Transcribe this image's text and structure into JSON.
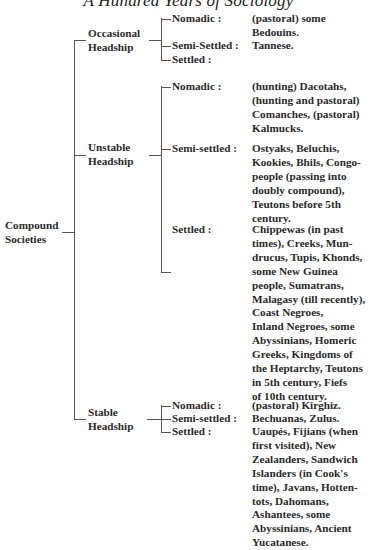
{
  "page": {
    "running_header": "A Hundred Years of Sociology"
  },
  "root": {
    "label_lines": [
      "Compound",
      "Societies"
    ]
  },
  "groups": [
    {
      "label_lines": [
        "Occasional",
        "Headship"
      ],
      "rows": [
        {
          "label": "Nomadic :",
          "value_lines": [
            "(pastoral) some",
            "Bedouins."
          ]
        },
        {
          "label": "Semi-Settled :",
          "value_lines": [
            "Tannese."
          ]
        },
        {
          "label": "Settled :",
          "value_lines": []
        }
      ]
    },
    {
      "label_lines": [
        "Unstable",
        "Headship"
      ],
      "rows": [
        {
          "label": "Nomadic :",
          "value_lines": [
            "(hunting) Dacotahs,",
            "(hunting and pastoral)",
            "Comanches, (pastoral)",
            "Kalmucks."
          ]
        },
        {
          "label": "Semi-settled :",
          "value_lines": [
            "Ostyaks, Beluchis,",
            "Kookies, Bhils, Congo-",
            "people (passing into",
            "doubly compound),",
            "Teutons before 5th",
            "century."
          ]
        },
        {
          "label": "Settled :",
          "value_lines": [
            "Chippewas (in past",
            "times), Creeks, Mun-",
            "drucus, Tupis, Khonds,",
            "some New Guinea",
            "people, Sumatrans,",
            "Malagasy (till recently),",
            "Coast Negroes,",
            "Inland Negroes, some",
            "Abyssinians, Homeric",
            "Greeks, Kingdoms of",
            "the Heptarchy, Teutons",
            "in 5th century, Fiefs",
            "of 10th century."
          ]
        }
      ]
    },
    {
      "label_lines": [
        "Stable",
        "Headship"
      ],
      "rows": [
        {
          "label": "Nomadic :",
          "value_lines": [
            "(pastoral) Kirghiz."
          ]
        },
        {
          "label": "Semi-settled :",
          "value_lines": [
            "Bechuanas, Zulus."
          ]
        },
        {
          "label": "Settled :",
          "value_lines": [
            "Uaupés, Fijians (when",
            "first visited), New",
            "Zealanders, Sandwich",
            "Islanders (in Cook's",
            "time), Javans, Hotten-",
            "tots, Dahomans,",
            "Ashantees, some",
            "Abyssinians, Ancient",
            "Yucatanese."
          ]
        }
      ]
    }
  ]
}
